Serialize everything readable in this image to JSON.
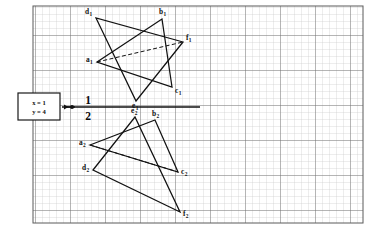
{
  "diagram": {
    "background_color": "#ffffff",
    "grid": {
      "type": "graph-paper",
      "x": 33,
      "y": 6,
      "width": 330,
      "height": 217,
      "minor_spacing": 7.0,
      "major_every": 5,
      "minor_color": "#c9c9c9",
      "major_color": "#6f6f6f",
      "border_color": "#5a5a5a"
    },
    "line_color": "#111111",
    "fold_line": {
      "label_top": "1",
      "label_bottom": "2",
      "y": 107,
      "x_start": 62,
      "x_end": 200,
      "tick_dot_x": 72,
      "arrow_x": 64,
      "num_top_x": 88,
      "num_top_y": 104,
      "num_bottom_x": 88,
      "num_bottom_y": 120
    },
    "callout_box": {
      "x": 18,
      "y": 93,
      "width": 42,
      "height": 27,
      "line1": "x = 1",
      "line2": "y = 4",
      "border_color": "#1a1a1a",
      "fill": "#ffffff"
    },
    "top_view": {
      "name": "horizontal-projection",
      "plane": "1",
      "vertices": [
        {
          "id": "a1",
          "label": "a",
          "subscript": "1",
          "x": 97,
          "y": 62,
          "label_x": 86,
          "label_y": 62
        },
        {
          "id": "b1",
          "label": "b",
          "subscript": "1",
          "x": 162,
          "y": 19,
          "label_x": 159,
          "label_y": 14
        },
        {
          "id": "c1",
          "label": "c",
          "subscript": "1",
          "x": 172,
          "y": 87,
          "label_x": 175,
          "label_y": 93
        },
        {
          "id": "d1",
          "label": "d",
          "subscript": "1",
          "x": 96,
          "y": 18,
          "label_x": 85,
          "label_y": 14
        },
        {
          "id": "e1",
          "label": "e",
          "subscript": "1",
          "x": 136,
          "y": 101,
          "label_x": 132,
          "label_y": 108
        },
        {
          "id": "f1",
          "label": "f",
          "subscript": "1",
          "x": 183,
          "y": 42,
          "label_x": 186,
          "label_y": 40
        }
      ],
      "triangles": [
        {
          "name": "triangle-abc-top",
          "points": "a1,b1,c1"
        },
        {
          "name": "triangle-def-top",
          "points": "d1,e1,f1"
        }
      ],
      "hidden_edges": [
        {
          "name": "hidden-edge-a1-f1",
          "from": "a1",
          "to": "f1"
        }
      ]
    },
    "front_view": {
      "name": "frontal-projection",
      "plane": "2",
      "vertices": [
        {
          "id": "a2",
          "label": "a",
          "subscript": "2",
          "x": 90,
          "y": 145,
          "label_x": 79,
          "label_y": 145
        },
        {
          "id": "b2",
          "label": "b",
          "subscript": "2",
          "x": 155,
          "y": 120,
          "label_x": 152,
          "label_y": 116
        },
        {
          "id": "c2",
          "label": "c",
          "subscript": "2",
          "x": 178,
          "y": 172,
          "label_x": 181,
          "label_y": 174
        },
        {
          "id": "d2",
          "label": "d",
          "subscript": "2",
          "x": 93,
          "y": 170,
          "label_x": 82,
          "label_y": 170
        },
        {
          "id": "e2",
          "label": "e",
          "subscript": "2",
          "x": 135,
          "y": 117,
          "label_x": 131,
          "label_y": 113
        },
        {
          "id": "f2",
          "label": "f",
          "subscript": "2",
          "x": 180,
          "y": 212,
          "label_x": 183,
          "label_y": 216
        }
      ],
      "triangles": [
        {
          "name": "triangle-abc-front",
          "points": "a2,b2,c2"
        },
        {
          "name": "triangle-def-front",
          "points": "d2,e2,f2"
        }
      ],
      "hidden_edges": [
        {
          "name": "hidden-edge-a2-c2",
          "from": "a2",
          "to": "c2"
        }
      ]
    }
  }
}
